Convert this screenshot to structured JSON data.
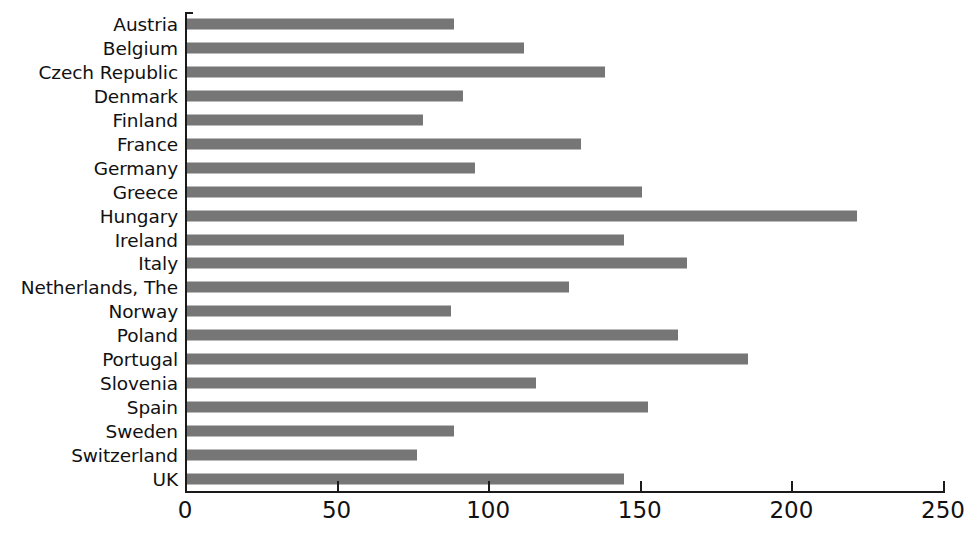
{
  "chart_data": {
    "type": "bar",
    "orientation": "horizontal",
    "title": "",
    "subtitle": "",
    "xlabel": "",
    "ylabel": "",
    "xlim": [
      0,
      250
    ],
    "xticks": [
      0,
      50,
      100,
      150,
      200,
      250
    ],
    "grid": false,
    "legend": null,
    "bar_color": "#767676",
    "axis_color": "#1a1a1a",
    "categories": [
      "Austria",
      "Belgium",
      "Czech Republic",
      "Denmark",
      "Finland",
      "France",
      "Germany",
      "Greece",
      "Hungary",
      "Ireland",
      "Italy",
      "Netherlands, The",
      "Norway",
      "Poland",
      "Portugal",
      "Slovenia",
      "Spain",
      "Sweden",
      "Switzerland",
      "UK"
    ],
    "values": [
      88,
      111,
      138,
      91,
      78,
      130,
      95,
      150,
      221,
      144,
      165,
      126,
      87,
      162,
      185,
      115,
      152,
      88,
      76,
      144
    ]
  }
}
